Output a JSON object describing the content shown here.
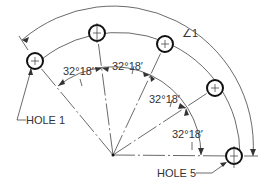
{
  "drawing": {
    "type": "bolt-circle-angular-dimensioning",
    "center": {
      "x": 113,
      "y": 155
    },
    "bolt_circle_radius": 122,
    "dimension_arc_radius": 140,
    "angle_arc_radius": 88,
    "hole_radius": 8,
    "holes": [
      {
        "id": "hole-1",
        "label": "HOLE 1",
        "x": 35,
        "y": 61
      },
      {
        "id": "hole-2",
        "label": "",
        "x": 97,
        "y": 33
      },
      {
        "id": "hole-3",
        "label": "",
        "x": 165,
        "y": 44
      },
      {
        "id": "hole-4",
        "label": "",
        "x": 215,
        "y": 88
      },
      {
        "id": "hole-5",
        "label": "HOLE 5",
        "x": 234,
        "y": 156
      }
    ],
    "angle_dimensions": [
      {
        "id": "angle-1-2",
        "text": "32°18′",
        "x": 76,
        "y": 77
      },
      {
        "id": "angle-2-3",
        "text": "32°18′",
        "x": 126,
        "y": 72
      },
      {
        "id": "angle-3-4",
        "text": "32°18′",
        "x": 148,
        "y": 103
      },
      {
        "id": "angle-4-5",
        "text": "32°18′",
        "x": 172,
        "y": 138
      }
    ],
    "overall_note": {
      "text": "∠1",
      "x": 180,
      "y": 34
    },
    "callouts": {
      "hole1": {
        "text": "HOLE 1",
        "x": 24,
        "y": 120
      },
      "hole5": {
        "text": "HOLE 5",
        "x": 157,
        "y": 177
      }
    },
    "colors": {
      "line": "#444444",
      "hole": "#111111",
      "text": "#333333",
      "background": "#ffffff"
    }
  }
}
